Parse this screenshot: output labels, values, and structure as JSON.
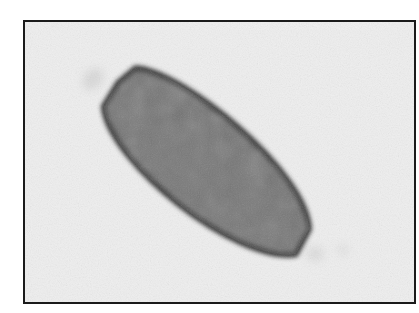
{
  "image": {
    "kind": "grayscale photomicrograph",
    "subject": "elongated barrel-shaped egg with polar ends",
    "colors": {
      "page_background": "#ffffff",
      "frame_border": "#1a1a1a",
      "field_background": "#efefef",
      "egg_interior": "#707070",
      "egg_wall": "#303030",
      "polar_halo": "#d8d8d8"
    },
    "geometry": {
      "frame": {
        "x": 23,
        "y": 20,
        "width": 391,
        "height": 282
      },
      "egg_center": {
        "x": 205,
        "y": 165
      },
      "egg_long_axis_px": 250,
      "egg_short_axis_px": 112,
      "egg_rotation_deg": 40
    }
  }
}
